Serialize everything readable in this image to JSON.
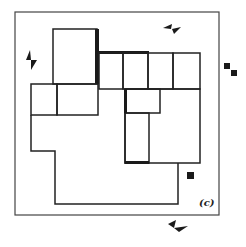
{
  "figure": {
    "label": "(c)",
    "stroke_color": "#333333",
    "fill_color": "#1a1a1a",
    "background": "#ffffff"
  },
  "markers": [
    {
      "name": "break-marker-top",
      "orientation": "horizontal"
    },
    {
      "name": "break-marker-left",
      "orientation": "vertical"
    },
    {
      "name": "break-marker-bottom",
      "orientation": "horizontal"
    }
  ],
  "squares": [
    {
      "name": "square-right-1"
    },
    {
      "name": "square-right-2"
    },
    {
      "name": "square-inner"
    }
  ]
}
